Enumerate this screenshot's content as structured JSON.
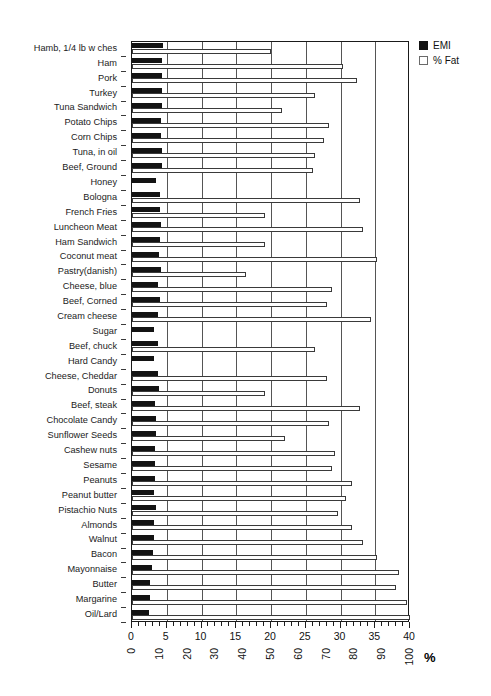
{
  "chart_data": {
    "type": "bar",
    "orientation": "horizontal",
    "title": "",
    "subtitle": "",
    "xlabel": "%",
    "ylabel": "",
    "grid": true,
    "legend_position": "top-right",
    "axes": {
      "top": {
        "name": "EMI",
        "ticks": [
          0,
          5,
          10,
          15,
          20,
          25,
          30,
          35,
          40
        ],
        "range": [
          0,
          40
        ],
        "minor_tick_step": 1
      },
      "bottom": {
        "name": "% Fat",
        "ticks": [
          0,
          10,
          20,
          30,
          40,
          50,
          60,
          70,
          80,
          90,
          100
        ],
        "range": [
          0,
          100
        ],
        "unit_label": "%"
      }
    },
    "legend": [
      {
        "label": "EMI",
        "swatch": "filled-black"
      },
      {
        "label": "% Fat",
        "swatch": "hollow-white"
      }
    ],
    "categories": [
      "Hamb, 1/4 lb w ches",
      "Ham",
      "Pork",
      "Turkey",
      "Tuna Sandwich",
      "Potato Chips",
      "Corn Chips",
      "Tuna, in oil",
      "Beef, Ground",
      "Honey",
      "Bologna",
      "French Fries",
      "Luncheon Meat",
      "Ham Sandwich",
      "Coconut meat",
      "Pastry(danish)",
      "Cheese, blue",
      "Beef, Corned",
      "Cream cheese",
      "Sugar",
      "Beef, chuck",
      "Hard Candy",
      "Cheese, Cheddar",
      "Donuts",
      "Beef, steak",
      "Chocolate Candy",
      "Sunflower Seeds",
      "Cashew nuts",
      "Sesame",
      "Peanuts",
      "Peanut butter",
      "Pistachio Nuts",
      "Almonds",
      "Walnut",
      "Bacon",
      "Mayonnaise",
      "Butter",
      "Margarine",
      "Oil/Lard"
    ],
    "series": [
      {
        "name": "EMI",
        "scale": "top",
        "max": 40,
        "values": [
          4.4,
          4.3,
          4.3,
          4.3,
          4.3,
          4.2,
          4.2,
          4.3,
          4.3,
          3.4,
          4.0,
          4.1,
          4.2,
          4.0,
          3.9,
          4.2,
          3.8,
          4.1,
          3.8,
          3.2,
          3.7,
          3.2,
          3.7,
          3.9,
          3.3,
          3.5,
          3.4,
          3.3,
          3.3,
          3.3,
          3.2,
          3.4,
          3.1,
          3.2,
          3.0,
          2.9,
          2.6,
          2.6,
          2.5
        ]
      },
      {
        "name": "% Fat",
        "scale": "bottom",
        "max": 100,
        "values": [
          50,
          76,
          81,
          66,
          54,
          71,
          69,
          66,
          65,
          0,
          82,
          48,
          83,
          48,
          88,
          41,
          72,
          70,
          86,
          0,
          66,
          0,
          70,
          48,
          82,
          71,
          55,
          73,
          72,
          79,
          77,
          74,
          79,
          83,
          88,
          96,
          95,
          99,
          100
        ]
      }
    ]
  }
}
